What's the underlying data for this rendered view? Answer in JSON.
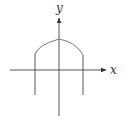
{
  "diagram": {
    "axes": {
      "x_label": "x",
      "y_label": "y"
    },
    "colors": {
      "axis": "#555555",
      "curve": "#777777",
      "background": "#ffffff"
    }
  }
}
